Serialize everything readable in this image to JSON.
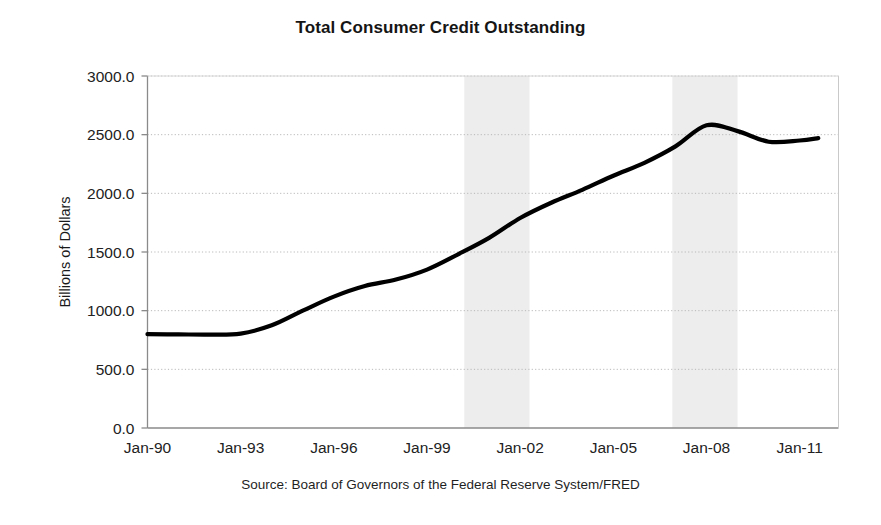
{
  "chart_data": {
    "type": "line",
    "title": "Total Consumer Credit Outstanding",
    "xlabel": "",
    "ylabel": "Billions of Dollars",
    "source": "Source: Board of Governors of the Federal Reserve System/FRED",
    "grid": true,
    "legend": "none",
    "xlim": [
      1990.0,
      2012.25
    ],
    "ylim": [
      0.0,
      3000.0
    ],
    "ytick_labels": [
      "3000.0",
      "2500.0",
      "2000.0",
      "1500.0",
      "1000.0",
      "500.0",
      "0.0"
    ],
    "ytick_values": [
      3000,
      2500,
      2000,
      1500,
      1000,
      500,
      0
    ],
    "xtick_labels": [
      "Jan-90",
      "Jan-93",
      "Jan-96",
      "Jan-99",
      "Jan-02",
      "Jan-05",
      "Jan-08",
      "Jan-11"
    ],
    "xtick_values": [
      1990,
      1993,
      1996,
      1999,
      2002,
      2005,
      2008,
      2011
    ],
    "series": [
      {
        "name": "Total Consumer Credit Outstanding",
        "color": "#000000",
        "line_width": 4.2,
        "x": [
          1990.0,
          1991.0,
          1992.0,
          1993.0,
          1994.0,
          1995.0,
          1996.0,
          1997.0,
          1998.0,
          1999.0,
          2000.0,
          2001.0,
          2002.0,
          2003.0,
          2004.0,
          2005.0,
          2006.0,
          2007.0,
          2008.0,
          2009.0,
          2010.0,
          2011.0,
          2011.6
        ],
        "y": [
          800,
          798,
          796,
          805,
          875,
          1000,
          1120,
          1210,
          1265,
          1350,
          1480,
          1620,
          1790,
          1920,
          2030,
          2150,
          2260,
          2400,
          2580,
          2530,
          2440,
          2450,
          2470
        ]
      }
    ],
    "shaded_regions": [
      {
        "label": "recession-band-1",
        "x_start": 2000.2,
        "x_end": 2002.3,
        "color": "#ededed"
      },
      {
        "label": "recession-band-2",
        "x_start": 2006.9,
        "x_end": 2009.0,
        "color": "#ededed"
      }
    ],
    "axis_color": "#8a8a8a",
    "gridline_color": "#b9b9b9",
    "plot_bg": "#ffffff"
  }
}
